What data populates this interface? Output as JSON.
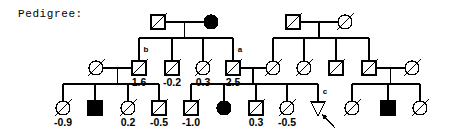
{
  "caption": "Pedigree:",
  "colors": {
    "line": "#000000",
    "fill_affected": "#000000",
    "fill_unaffected": "#ffffff",
    "background": "#ffffff"
  },
  "legend_semantics": {
    "square": "male",
    "circle": "female",
    "triangle": "pregnancy-or-unknown-sex",
    "diagonal_slash": "deceased",
    "solid_fill": "affected",
    "open": "unaffected",
    "arrow": "proband-indicator"
  },
  "chart_data": {
    "type": "diagram",
    "title": "Pedigree:",
    "generations": 3,
    "individuals": [
      {
        "id": "I-1",
        "gen": 1,
        "shape": "square",
        "affected": false,
        "deceased": true,
        "x": 158,
        "y": 22,
        "value": null,
        "label": null
      },
      {
        "id": "I-2",
        "gen": 1,
        "shape": "circle",
        "affected": true,
        "deceased": false,
        "x": 211,
        "y": 22,
        "value": null,
        "label": null
      },
      {
        "id": "I-3",
        "gen": 1,
        "shape": "square",
        "affected": false,
        "deceased": true,
        "x": 293,
        "y": 22,
        "value": null,
        "label": null
      },
      {
        "id": "I-4",
        "gen": 1,
        "shape": "circle",
        "affected": false,
        "deceased": true,
        "x": 345,
        "y": 22,
        "value": null,
        "label": null
      },
      {
        "id": "II-1",
        "gen": 2,
        "shape": "circle",
        "affected": false,
        "deceased": true,
        "x": 96,
        "y": 68,
        "value": null,
        "label": null
      },
      {
        "id": "II-2",
        "gen": 2,
        "shape": "square",
        "affected": false,
        "deceased": true,
        "x": 139,
        "y": 68,
        "value": "1.6",
        "label": "b"
      },
      {
        "id": "II-3",
        "gen": 2,
        "shape": "square",
        "affected": false,
        "deceased": true,
        "x": 172,
        "y": 68,
        "value": "-0.2",
        "label": null
      },
      {
        "id": "II-4",
        "gen": 2,
        "shape": "circle",
        "affected": false,
        "deceased": true,
        "x": 203,
        "y": 68,
        "value": "0.3",
        "label": null
      },
      {
        "id": "II-5",
        "gen": 2,
        "shape": "square",
        "affected": false,
        "deceased": true,
        "x": 233,
        "y": 68,
        "value": "2.5",
        "label": "a"
      },
      {
        "id": "II-6",
        "gen": 2,
        "shape": "circle",
        "affected": false,
        "deceased": true,
        "x": 273,
        "y": 68,
        "value": null,
        "label": null
      },
      {
        "id": "II-7",
        "gen": 2,
        "shape": "circle",
        "affected": false,
        "deceased": true,
        "x": 304,
        "y": 68,
        "value": null,
        "label": null
      },
      {
        "id": "II-8",
        "gen": 2,
        "shape": "square",
        "affected": false,
        "deceased": true,
        "x": 336,
        "y": 68,
        "value": null,
        "label": null
      },
      {
        "id": "II-9",
        "gen": 2,
        "shape": "square",
        "affected": false,
        "deceased": true,
        "x": 369,
        "y": 68,
        "value": null,
        "label": null
      },
      {
        "id": "II-10",
        "gen": 2,
        "shape": "circle",
        "affected": false,
        "deceased": true,
        "x": 412,
        "y": 68,
        "value": null,
        "label": null
      },
      {
        "id": "III-1",
        "gen": 3,
        "shape": "circle",
        "affected": false,
        "deceased": true,
        "x": 63,
        "y": 108,
        "value": "-0.9",
        "label": null
      },
      {
        "id": "III-2",
        "gen": 3,
        "shape": "square",
        "affected": true,
        "deceased": false,
        "x": 95,
        "y": 108,
        "value": null,
        "label": null
      },
      {
        "id": "III-3",
        "gen": 3,
        "shape": "circle",
        "affected": false,
        "deceased": true,
        "x": 128,
        "y": 108,
        "value": "0.2",
        "label": null
      },
      {
        "id": "III-4",
        "gen": 3,
        "shape": "square",
        "affected": false,
        "deceased": true,
        "x": 159,
        "y": 108,
        "value": "-0.5",
        "label": null
      },
      {
        "id": "III-5",
        "gen": 3,
        "shape": "square",
        "affected": false,
        "deceased": true,
        "x": 191,
        "y": 108,
        "value": "-1.0",
        "label": null
      },
      {
        "id": "III-6",
        "gen": 3,
        "shape": "circle",
        "affected": true,
        "deceased": false,
        "x": 224,
        "y": 108,
        "value": null,
        "label": null
      },
      {
        "id": "III-7",
        "gen": 3,
        "shape": "square",
        "affected": false,
        "deceased": true,
        "x": 256,
        "y": 108,
        "value": "0.3",
        "label": null
      },
      {
        "id": "III-8",
        "gen": 3,
        "shape": "circle",
        "affected": false,
        "deceased": true,
        "x": 287,
        "y": 108,
        "value": "-0.5",
        "label": null
      },
      {
        "id": "III-9",
        "gen": 3,
        "shape": "triangle",
        "affected": false,
        "deceased": false,
        "x": 318,
        "y": 108,
        "value": null,
        "label": "c",
        "proband": true
      },
      {
        "id": "III-10",
        "gen": 3,
        "shape": "circle",
        "affected": false,
        "deceased": true,
        "x": 352,
        "y": 108,
        "value": null,
        "label": null
      },
      {
        "id": "III-11",
        "gen": 3,
        "shape": "square",
        "affected": true,
        "deceased": false,
        "x": 388,
        "y": 108,
        "value": null,
        "label": null
      },
      {
        "id": "III-12",
        "gen": 3,
        "shape": "circle",
        "affected": false,
        "deceased": true,
        "x": 420,
        "y": 108,
        "value": null,
        "label": null
      }
    ],
    "matings": [
      {
        "id": "M1",
        "partners": [
          "I-1",
          "I-2"
        ],
        "children": [
          "II-2",
          "II-3",
          "II-4",
          "II-5"
        ]
      },
      {
        "id": "M2",
        "partners": [
          "I-3",
          "I-4"
        ],
        "children": [
          "II-6",
          "II-7",
          "II-8",
          "II-9"
        ]
      },
      {
        "id": "M3",
        "partners": [
          "II-1",
          "II-2"
        ],
        "children": [
          "III-1",
          "III-2",
          "III-3",
          "III-4"
        ]
      },
      {
        "id": "M4",
        "partners": [
          "II-5",
          "II-6"
        ],
        "children": [
          "III-5",
          "III-6",
          "III-7",
          "III-8",
          "III-9"
        ]
      },
      {
        "id": "M5",
        "partners": [
          "II-9",
          "II-10"
        ],
        "children": [
          "III-10",
          "III-11",
          "III-12"
        ]
      }
    ],
    "annotations": [
      {
        "name": "label-b",
        "text": "b",
        "x": 146,
        "y": 52
      },
      {
        "name": "label-a",
        "text": "a",
        "x": 240,
        "y": 52
      },
      {
        "name": "label-c",
        "text": "c",
        "x": 325,
        "y": 94
      },
      {
        "name": "proband-arrow",
        "text": "",
        "x": 332,
        "y": 122
      }
    ],
    "values_listed": [
      "1.6",
      "-0.2",
      "0.3",
      "2.5",
      "-0.9",
      "0.2",
      "-0.5",
      "-1.0",
      "0.3",
      "-0.5"
    ]
  }
}
